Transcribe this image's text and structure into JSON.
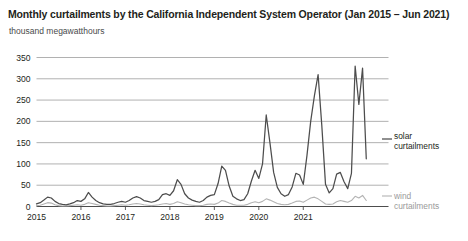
{
  "chart_data": {
    "type": "line",
    "title": "Monthly curtailments by the California Independent System Operator (Jan 2015 – Jun 2021)",
    "subtitle": "thousand megawatthours",
    "xlabel": "",
    "ylabel": "thousand megawatthours",
    "ylim": [
      0,
      350
    ],
    "yticks": [
      0,
      50,
      100,
      150,
      200,
      250,
      300,
      350
    ],
    "ytick_labels": [
      "0",
      "50",
      "100",
      "150",
      "200",
      "250",
      "300",
      "350"
    ],
    "xticks": [
      "2015",
      "2016",
      "2017",
      "2018",
      "2019",
      "2020",
      "2021"
    ],
    "grid": true,
    "legend_position": "right",
    "x_start": "2015-01",
    "x_end": "2021-06",
    "colors": {
      "solar": "#4d4d4d",
      "wind": "#b3b3b3",
      "grid": "#a8a8a8",
      "axis": "#4d4d4d",
      "text": "#231f20"
    },
    "series": [
      {
        "name": "solar curtailments",
        "label": "solar\ncurtailments",
        "label_line1": "solar",
        "label_line2": "curtailments",
        "color": "#4d4d4d",
        "values": [
          6,
          9,
          15,
          22,
          20,
          12,
          7,
          5,
          4,
          6,
          9,
          14,
          12,
          18,
          33,
          22,
          14,
          9,
          6,
          5,
          5,
          7,
          10,
          12,
          10,
          14,
          20,
          23,
          20,
          14,
          12,
          10,
          12,
          16,
          28,
          30,
          26,
          37,
          63,
          52,
          30,
          20,
          15,
          12,
          10,
          14,
          22,
          26,
          28,
          54,
          95,
          85,
          48,
          24,
          18,
          14,
          16,
          30,
          60,
          85,
          66,
          100,
          215,
          150,
          80,
          45,
          30,
          24,
          28,
          46,
          78,
          74,
          52,
          120,
          200,
          260,
          310,
          190,
          52,
          32,
          42,
          76,
          80,
          58,
          42,
          78,
          330,
          240,
          325,
          112
        ]
      },
      {
        "name": "wind curtailments",
        "label": "wind\ncurtailments",
        "label_line1": "wind",
        "label_line2": "curtailments",
        "color": "#b3b3b3",
        "values": [
          2,
          3,
          6,
          9,
          8,
          4,
          2,
          1,
          1,
          2,
          3,
          4,
          3,
          5,
          9,
          7,
          5,
          3,
          2,
          1,
          1,
          2,
          3,
          4,
          3,
          4,
          6,
          7,
          6,
          4,
          3,
          2,
          3,
          4,
          6,
          7,
          5,
          7,
          11,
          9,
          6,
          4,
          3,
          2,
          2,
          3,
          5,
          6,
          5,
          8,
          14,
          12,
          8,
          5,
          3,
          3,
          3,
          5,
          9,
          11,
          9,
          12,
          18,
          15,
          11,
          7,
          5,
          4,
          5,
          8,
          12,
          13,
          10,
          15,
          20,
          22,
          18,
          12,
          6,
          5,
          6,
          11,
          14,
          12,
          10,
          14,
          24,
          20,
          26,
          14
        ]
      }
    ],
    "annotations": []
  }
}
